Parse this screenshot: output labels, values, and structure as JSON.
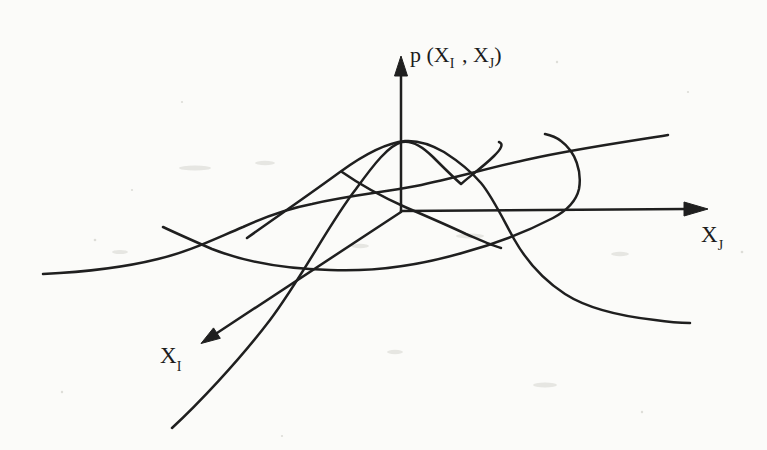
{
  "figure": {
    "ink_color": "#1f1f1f",
    "paper_color": "#fbfbf9",
    "labels": {
      "vertical_axis": {
        "prefix": "p (X",
        "sub_i": "I",
        "mid": " , X",
        "sub_j": "J",
        "suffix": ")"
      },
      "horizontal_axis": {
        "base": "X",
        "sub": "J"
      },
      "diagonal_axis": {
        "base": "X",
        "sub": "I"
      }
    }
  }
}
